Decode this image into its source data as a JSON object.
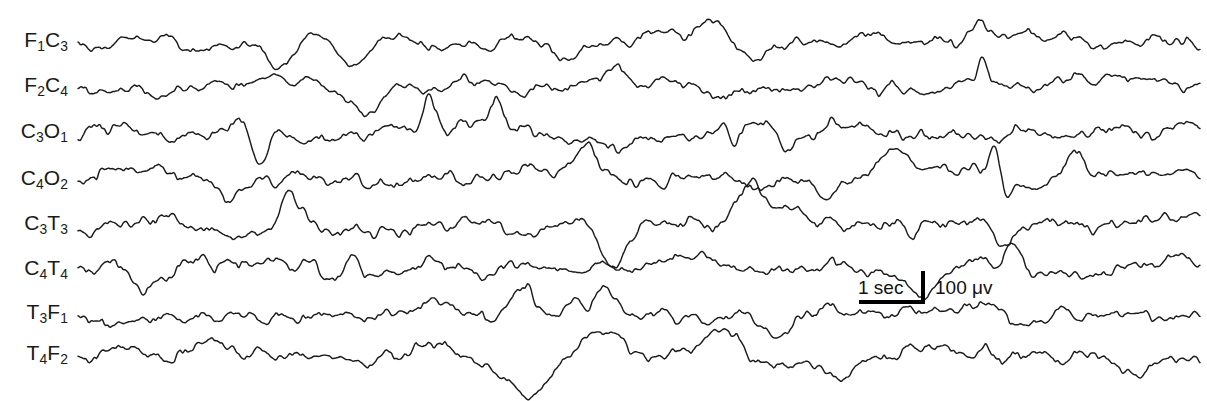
{
  "figure": {
    "kind": "eeg-polygraph-recording",
    "background_color": "#ffffff",
    "trace_color": "#1b1b1b",
    "label_color": "#1a1a1a",
    "width": 1207,
    "height": 401
  },
  "channels": [
    {
      "label_html": "F<sub>1</sub>C<sub>3</sub>",
      "plain": "F1C3",
      "baseline_y": 40
    },
    {
      "label_html": "F<sub>2</sub>C<sub>4</sub>",
      "plain": "F2C4",
      "baseline_y": 85
    },
    {
      "label_html": "C<sub>3</sub>O<sub>1</sub>",
      "plain": "C3O1",
      "baseline_y": 131
    },
    {
      "label_html": "C<sub>4</sub>O<sub>2</sub>",
      "plain": "C4O2",
      "baseline_y": 178
    },
    {
      "label_html": "C<sub>3</sub>T<sub>3</sub>",
      "plain": "C3T3",
      "baseline_y": 223
    },
    {
      "label_html": "C<sub>4</sub>T<sub>4</sub>",
      "plain": "C4T4",
      "baseline_y": 268
    },
    {
      "label_html": "T<sub>3</sub>F<sub>1</sub>",
      "plain": "T3F1",
      "baseline_y": 312
    },
    {
      "label_html": "T<sub>4</sub>F<sub>2</sub>",
      "plain": "T4F2",
      "baseline_y": 353
    }
  ],
  "calibration": {
    "time_label": "1 sec",
    "amplitude_label": "100 μv",
    "time_bar_px": 66,
    "amplitude_bar_px": 33
  },
  "chart_data": {
    "type": "line",
    "title": "",
    "xlabel": "time",
    "ylabel": "amplitude",
    "grid": false,
    "legend": "none",
    "n_series": 8,
    "x_start_px": 78,
    "x_end_px": 1200,
    "calibration": {
      "time": "1 sec",
      "amplitude": "100 μv"
    },
    "series": [
      {
        "name": "F1C3",
        "baseline_y": 40,
        "amplitude_px": 13,
        "seed": 11
      },
      {
        "name": "F2C4",
        "baseline_y": 85,
        "amplitude_px": 13,
        "seed": 23
      },
      {
        "name": "C3O1",
        "baseline_y": 131,
        "amplitude_px": 15,
        "seed": 37
      },
      {
        "name": "C4O2",
        "baseline_y": 178,
        "amplitude_px": 15,
        "seed": 51
      },
      {
        "name": "C3T3",
        "baseline_y": 223,
        "amplitude_px": 14,
        "seed": 67
      },
      {
        "name": "C4T4",
        "baseline_y": 268,
        "amplitude_px": 15,
        "seed": 83
      },
      {
        "name": "T3F1",
        "baseline_y": 312,
        "amplitude_px": 13,
        "seed": 97
      },
      {
        "name": "T4F2",
        "baseline_y": 353,
        "amplitude_px": 14,
        "seed": 113
      }
    ]
  }
}
